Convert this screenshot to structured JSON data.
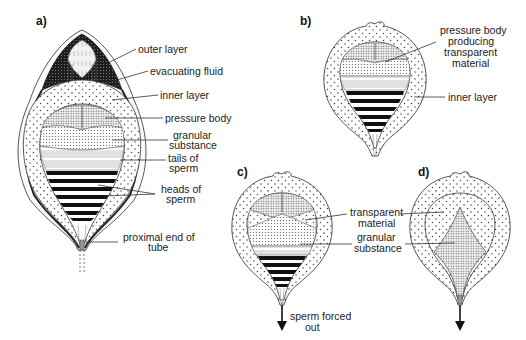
{
  "figure": {
    "panels": [
      {
        "id": "a",
        "label": "a)",
        "annotations": [
          {
            "id": "outer-layer",
            "lines": [
              "outer layer"
            ]
          },
          {
            "id": "evacuating-fluid",
            "lines": [
              "evacuating fluid"
            ]
          },
          {
            "id": "inner-layer",
            "lines": [
              "inner layer"
            ]
          },
          {
            "id": "pressure-body",
            "lines": [
              "pressure body"
            ]
          },
          {
            "id": "granular-substance",
            "lines": [
              "granular",
              "substance"
            ]
          },
          {
            "id": "tails-of-sperm",
            "lines": [
              "tails of",
              "sperm"
            ]
          },
          {
            "id": "heads-of-sperm",
            "lines": [
              "heads of",
              "sperm"
            ]
          },
          {
            "id": "proximal-end-of-tube",
            "lines": [
              "proximal end of",
              "tube"
            ]
          }
        ]
      },
      {
        "id": "b",
        "label": "b)",
        "annotations": [
          {
            "id": "pressure-body-producing",
            "lines": [
              "pressure body",
              "producing",
              "transparent",
              "material"
            ]
          },
          {
            "id": "inner-layer",
            "lines": [
              "inner layer"
            ]
          }
        ]
      },
      {
        "id": "c",
        "label": "c)",
        "annotations": [
          {
            "id": "transparent-material",
            "lines": [
              "transparent",
              "material"
            ]
          },
          {
            "id": "granular-substance",
            "lines": [
              "granular",
              "substance"
            ]
          },
          {
            "id": "sperm-forced-out",
            "lines": [
              "sperm forced",
              "out"
            ]
          }
        ]
      },
      {
        "id": "d",
        "label": "d)",
        "annotations": []
      }
    ]
  },
  "colors": {
    "ink": "#222222",
    "dark_fill": "#2a2a2a",
    "background": "#ffffff"
  }
}
